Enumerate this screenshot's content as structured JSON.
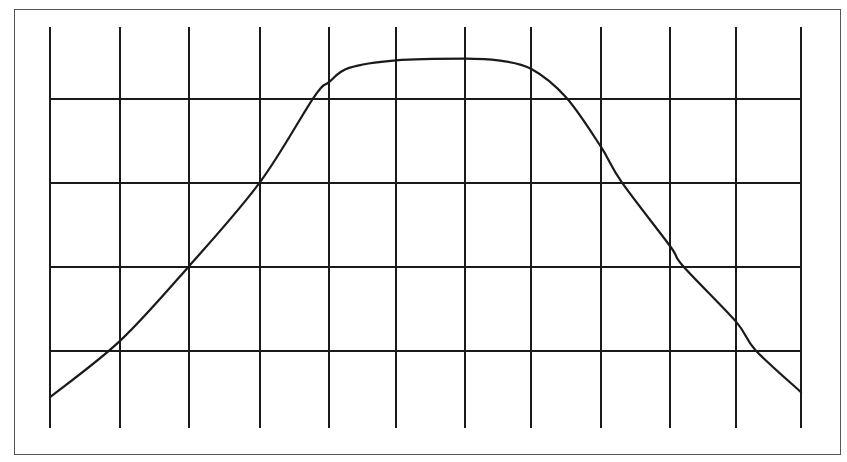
{
  "chart_data": {
    "type": "line",
    "title": "",
    "xlabel": "",
    "ylabel": "",
    "grid": true,
    "legend": null,
    "xlim": [
      0,
      11
    ],
    "ylim": [
      0,
      5
    ],
    "x_gridlines": [
      0,
      1,
      2,
      3,
      4,
      5,
      6,
      7,
      8,
      9,
      10,
      11
    ],
    "y_gridlines": [
      1,
      2,
      3,
      4
    ],
    "series": [
      {
        "name": "curve",
        "x": [
          0,
          1,
          2,
          3,
          3.78,
          4,
          4.3,
          5,
          6,
          6.5,
          7,
          7.5,
          8,
          8.3,
          9,
          9.2,
          10,
          10.3,
          11
        ],
        "y": [
          0.45,
          1.12,
          2.01,
          3.01,
          4.02,
          4.2,
          4.37,
          4.46,
          4.48,
          4.46,
          4.36,
          4.02,
          3.43,
          3.01,
          2.25,
          2.01,
          1.35,
          1.01,
          0.51
        ]
      }
    ]
  },
  "style": {
    "line_color": "#1a1a1a",
    "grid_color": "#1a1a1a",
    "frame_color": "#555555",
    "background": "#ffffff"
  }
}
